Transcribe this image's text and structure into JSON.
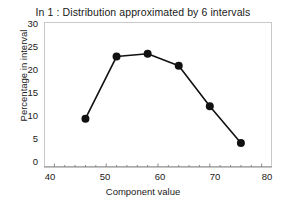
{
  "chart_data": {
    "type": "line",
    "title": "In 1 : Distribution approximated by 6 intervals",
    "xlabel": "Component value",
    "ylabel": "Percentage in interval",
    "x": [
      46,
      52,
      58,
      64,
      70,
      76
    ],
    "values": [
      10.5,
      24.0,
      24.6,
      22.0,
      13.2,
      5.2
    ],
    "series": [
      {
        "name": "Percentage in interval",
        "x": [
          46,
          52,
          58,
          64,
          70,
          76
        ],
        "values": [
          10.5,
          24.0,
          24.6,
          22.0,
          13.2,
          5.2
        ]
      }
    ],
    "xlim": [
      38,
      82
    ],
    "ylim": [
      0,
      31.5
    ],
    "xticks": [
      40,
      50,
      60,
      70,
      80
    ],
    "yticks": [
      0,
      5,
      10,
      15,
      20,
      25,
      30
    ],
    "xtick_labels": [
      "40",
      "50",
      "60",
      "70",
      "80"
    ],
    "ytick_labels": [
      "0",
      "5",
      "10",
      "15",
      "20",
      "25",
      "30"
    ],
    "grid": false,
    "legend": false,
    "legend_position": "none",
    "marker": "filled-circle",
    "marker_color": "#111111",
    "line_color": "#111111",
    "frame_color": "#c9c9c9",
    "background_color": "#ffffff",
    "text_color": "#1a1a1a"
  }
}
